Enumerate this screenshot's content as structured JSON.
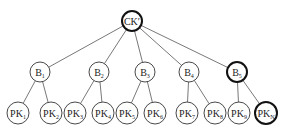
{
  "diagram": {
    "type": "tree",
    "colors": {
      "line": "#555555",
      "node_stroke": "#333333",
      "bold_stroke": "#111111",
      "background": "#ffffff"
    },
    "root": {
      "id": "CK",
      "label": "CK",
      "suffix": "′",
      "x": 132,
      "y": 21,
      "r": 10,
      "bold": true
    },
    "level1": [
      {
        "id": "B1",
        "label": "B",
        "sub": "1",
        "x": 40,
        "y": 72,
        "r": 10,
        "bold": false
      },
      {
        "id": "B2",
        "label": "B",
        "sub": "2",
        "x": 99,
        "y": 72,
        "r": 10,
        "bold": false
      },
      {
        "id": "B3",
        "label": "B",
        "sub": "3",
        "x": 145,
        "y": 72,
        "r": 10,
        "bold": false
      },
      {
        "id": "B4",
        "label": "B",
        "sub": "4",
        "x": 189,
        "y": 72,
        "r": 10,
        "bold": false
      },
      {
        "id": "B5",
        "label": "B",
        "sub": "5",
        "x": 237,
        "y": 72,
        "r": 10,
        "bold": true
      }
    ],
    "leaves": [
      {
        "id": "PK1",
        "label": "PK",
        "sub": "1",
        "parent": "B1",
        "x": 18,
        "y": 113,
        "r": 11,
        "bold": false
      },
      {
        "id": "PK2",
        "label": "PK",
        "sub": "2",
        "parent": "B1",
        "x": 51,
        "y": 113,
        "r": 11,
        "bold": false
      },
      {
        "id": "PK3",
        "label": "PK",
        "sub": "3",
        "parent": "B2",
        "x": 75,
        "y": 113,
        "r": 11,
        "bold": false
      },
      {
        "id": "PK4",
        "label": "PK",
        "sub": "4",
        "parent": "B2",
        "x": 103,
        "y": 113,
        "r": 11,
        "bold": false
      },
      {
        "id": "PK5",
        "label": "PK",
        "sub": "5",
        "parent": "B3",
        "x": 127,
        "y": 113,
        "r": 11,
        "bold": false
      },
      {
        "id": "PK6",
        "label": "PK",
        "sub": "6",
        "parent": "B3",
        "x": 155,
        "y": 113,
        "r": 11,
        "bold": false
      },
      {
        "id": "PK7",
        "label": "PK",
        "sub": "7",
        "parent": "B4",
        "x": 187,
        "y": 113,
        "r": 11,
        "bold": false
      },
      {
        "id": "PK8",
        "label": "PK",
        "sub": "8",
        "parent": "B4",
        "x": 215,
        "y": 113,
        "r": 11,
        "bold": false
      },
      {
        "id": "PK9",
        "label": "PK",
        "sub": "9",
        "parent": "B5",
        "x": 239,
        "y": 113,
        "r": 11,
        "bold": false
      },
      {
        "id": "PKN",
        "label": "PK",
        "sub": "N",
        "parent": "B5",
        "x": 266,
        "y": 113,
        "r": 11,
        "bold": true
      }
    ]
  }
}
